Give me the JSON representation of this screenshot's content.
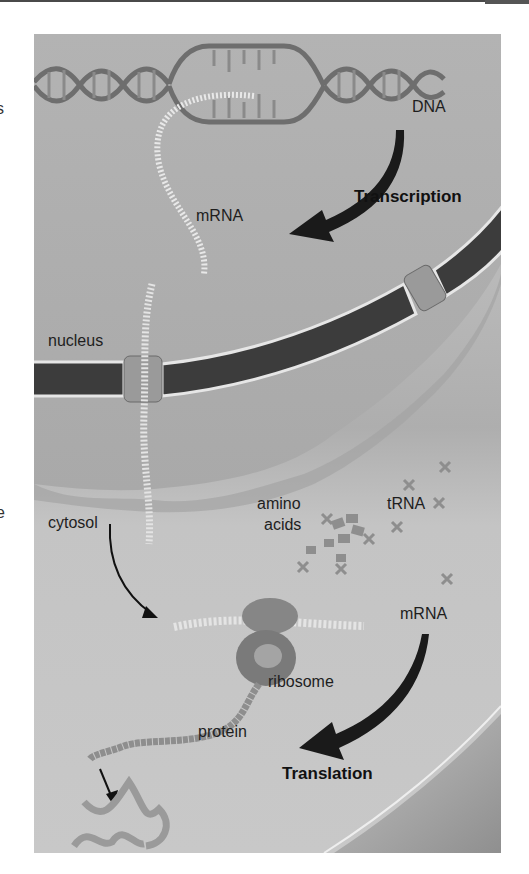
{
  "figure": {
    "labels": {
      "dna": "DNA",
      "transcription": "Transcription",
      "mrna_top": "mRNA",
      "nucleus": "nucleus",
      "cytosol": "cytosol",
      "amino": "amino",
      "acids": "acids",
      "trna": "tRNA",
      "mrna_bottom": "mRNA",
      "ribosome": "ribosome",
      "protein": "protein",
      "translation": "Translation"
    },
    "edge_fragments": [
      "s",
      "e"
    ],
    "colors": {
      "panel_bg": "#b9b9b9",
      "cytosol_bg": "#c6c6c6",
      "nuclear_envelope": "#3c3c3c",
      "envelope_outline": "#e6e6e6",
      "arrow": "#1a1a1a",
      "text": "#1e1e1e"
    }
  }
}
